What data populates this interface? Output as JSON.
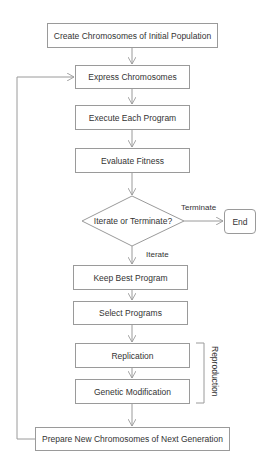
{
  "diagram": {
    "type": "flowchart",
    "colors": {
      "stroke": "#9a9a9a",
      "text": "#333333",
      "background": "#ffffff"
    },
    "nodes": {
      "create": "Create Chromosomes of Initial Population",
      "express": "Express Chromosomes",
      "execute": "Execute Each Program",
      "evaluate": "Evaluate Fitness",
      "decision": "Iterate or Terminate?",
      "end": "End",
      "keep_best": "Keep Best Program",
      "select": "Select Programs",
      "replication": "Replication",
      "genetic_mod": "Genetic Modification",
      "prepare": "Prepare New Chromosomes of Next Generation"
    },
    "edge_labels": {
      "terminate": "Terminate",
      "iterate": "Iterate"
    },
    "group_label": "Reproduction"
  }
}
